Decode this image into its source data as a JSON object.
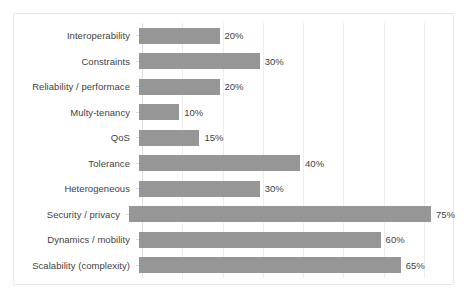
{
  "chart_data": {
    "type": "bar",
    "orientation": "horizontal",
    "title": "",
    "xlabel": "",
    "ylabel": "",
    "xlim": [
      0,
      75
    ],
    "grid": true,
    "grid_axis": "x",
    "gridline_step_percent": 10,
    "legend": "none",
    "bar_color": "#969696",
    "value_suffix": "%",
    "categories": [
      "Interoperability",
      "Constraints",
      "Reliability / performace",
      "Multy-tenancy",
      "QoS",
      "Tolerance",
      "Heterogeneous",
      "Security / privacy",
      "Dynamics / mobility",
      "Scalability (complexity)"
    ],
    "values": [
      20,
      30,
      20,
      10,
      15,
      40,
      30,
      75,
      60,
      65
    ],
    "data_labels": [
      "20%",
      "30%",
      "20%",
      "10%",
      "15%",
      "40%",
      "30%",
      "75%",
      "60%",
      "65%"
    ],
    "points": [
      {
        "category": "Interoperability",
        "value": 20,
        "label": "20%"
      },
      {
        "category": "Constraints",
        "value": 30,
        "label": "30%"
      },
      {
        "category": "Reliability / performace",
        "value": 20,
        "label": "20%"
      },
      {
        "category": "Multy-tenancy",
        "value": 10,
        "label": "10%"
      },
      {
        "category": "QoS",
        "value": 15,
        "label": "15%"
      },
      {
        "category": "Tolerance",
        "value": 40,
        "label": "40%"
      },
      {
        "category": "Heterogeneous",
        "value": 30,
        "label": "30%"
      },
      {
        "category": "Security / privacy",
        "value": 75,
        "label": "75%"
      },
      {
        "category": "Dynamics / mobility",
        "value": 60,
        "label": "60%"
      },
      {
        "category": "Scalability (complexity)",
        "value": 65,
        "label": "65%"
      }
    ]
  },
  "style": {
    "canvas_background": "#ffffff",
    "frame_border_color": "#e8e8e8",
    "gridline_color": "#ededed",
    "label_color": "#3f3f3f"
  }
}
